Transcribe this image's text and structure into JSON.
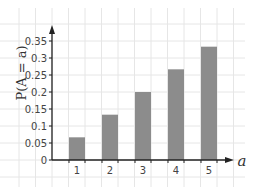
{
  "chart_data": {
    "type": "bar",
    "title": "",
    "xlabel": "a",
    "ylabel": "P(A = a)",
    "categories": [
      "1",
      "2",
      "3",
      "4",
      "5"
    ],
    "values": [
      0.0667,
      0.1333,
      0.2,
      0.2667,
      0.3333
    ],
    "yticks": [
      "0",
      "0.05",
      "0.1",
      "0.15",
      "0.2",
      "0.25",
      "0.3",
      "0.35"
    ],
    "ylim": [
      0,
      0.38
    ],
    "grid": true,
    "legend": "none",
    "bar_color": "#8c8c8c",
    "grid_color": "#e6e6e6",
    "axis_color": "#222222"
  }
}
